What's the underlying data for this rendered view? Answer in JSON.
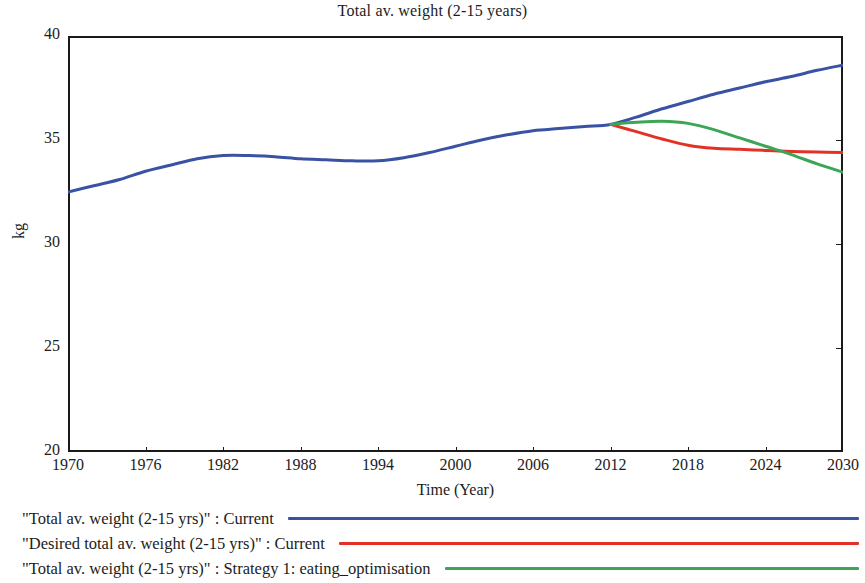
{
  "chart_data": {
    "type": "line",
    "title": "Total av. weight (2-15 years)",
    "xlabel": "Time (Year)",
    "ylabel": "kg",
    "xlim": [
      1970,
      2030
    ],
    "ylim": [
      20,
      40
    ],
    "xticks": [
      1970,
      1976,
      1982,
      1988,
      1994,
      2000,
      2006,
      2012,
      2018,
      2024,
      2030
    ],
    "yticks": [
      20,
      25,
      30,
      35,
      40
    ],
    "grid": false,
    "legend_position": "below",
    "series": [
      {
        "name": "\"Total av. weight (2-15 yrs)\" : Current",
        "color": "#3a52a4",
        "x": [
          1970,
          1972,
          1974,
          1976,
          1978,
          1980,
          1982,
          1984,
          1986,
          1988,
          1990,
          1992,
          1994,
          1996,
          1998,
          2000,
          2002,
          2004,
          2006,
          2008,
          2010,
          2012,
          2014,
          2016,
          2018,
          2020,
          2022,
          2024,
          2026,
          2028,
          2030
        ],
        "y": [
          32.5,
          32.8,
          33.1,
          33.5,
          33.8,
          34.1,
          34.25,
          34.25,
          34.2,
          34.1,
          34.05,
          34.0,
          34.0,
          34.15,
          34.4,
          34.7,
          35.0,
          35.25,
          35.45,
          35.55,
          35.65,
          35.75,
          36.1,
          36.5,
          36.85,
          37.2,
          37.5,
          37.8,
          38.05,
          38.35,
          38.6
        ]
      },
      {
        "name": "\"Desired total av. weight (2-15 yrs)\" : Current",
        "color": "#e23226",
        "x": [
          2012,
          2014,
          2016,
          2018,
          2020,
          2022,
          2024,
          2026,
          2028,
          2030
        ],
        "y": [
          35.75,
          35.4,
          35.05,
          34.75,
          34.6,
          34.55,
          34.5,
          34.45,
          34.42,
          34.4
        ]
      },
      {
        "name": "\"Total av. weight (2-15 yrs)\" : Strategy 1: eating_optimisation",
        "color": "#3da557",
        "x": [
          2012,
          2014,
          2016,
          2018,
          2020,
          2022,
          2024,
          2026,
          2028,
          2030
        ],
        "y": [
          35.75,
          35.85,
          35.9,
          35.8,
          35.5,
          35.1,
          34.7,
          34.3,
          33.85,
          33.45
        ]
      }
    ]
  },
  "legend": {
    "entries": [
      {
        "label": "\"Total av. weight (2-15 yrs)\" : Current",
        "color": "#3a52a4"
      },
      {
        "label": "\"Desired total av. weight (2-15 yrs)\" : Current",
        "color": "#e23226"
      },
      {
        "label": "\"Total av. weight (2-15 yrs)\" : Strategy 1: eating_optimisation",
        "color": "#3da557"
      }
    ]
  }
}
